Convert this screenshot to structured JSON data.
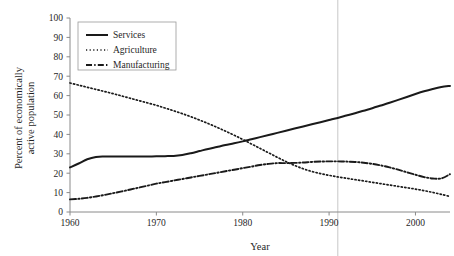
{
  "chart_data": {
    "type": "line",
    "title": "",
    "xlabel": "Year",
    "ylabel": "Percent of economically active population",
    "ylabel_line1": "Percent of economically",
    "ylabel_line2": "active population",
    "xlim": [
      1960,
      2004
    ],
    "ylim": [
      0,
      100
    ],
    "grid": false,
    "legend_position": "top-left",
    "xticks": [
      1960,
      1970,
      1980,
      1990,
      2000
    ],
    "xtick_labels": [
      "1960",
      "1970",
      "1980",
      "1990",
      "2000"
    ],
    "yticks": [
      0,
      10,
      20,
      30,
      40,
      50,
      60,
      70,
      80,
      90,
      100
    ],
    "ytick_labels": [
      "0",
      "10",
      "20",
      "30",
      "40",
      "50",
      "60",
      "70",
      "80",
      "90",
      "100"
    ],
    "annotations": [
      {
        "name": "reference-line-1991",
        "type": "vline",
        "x": 1991,
        "color": "#d8d8d8"
      }
    ],
    "series": [
      {
        "name": "Services",
        "style": "solid",
        "color": "#1a1a1a",
        "x": [
          1960,
          1961,
          1962,
          1963,
          1964,
          1965,
          1966,
          1967,
          1968,
          1969,
          1970,
          1971,
          1972,
          1973,
          1974,
          1975,
          1976,
          1977,
          1978,
          1979,
          1980,
          1981,
          1982,
          1983,
          1984,
          1985,
          1986,
          1987,
          1988,
          1989,
          1990,
          1991,
          1992,
          1993,
          1994,
          1995,
          1996,
          1997,
          1998,
          1999,
          2000,
          2001,
          2002,
          2003,
          2004
        ],
        "values": [
          23.0,
          25.0,
          27.2,
          28.4,
          28.6,
          28.6,
          28.6,
          28.6,
          28.6,
          28.6,
          28.7,
          28.8,
          28.9,
          29.4,
          30.3,
          31.4,
          32.5,
          33.5,
          34.5,
          35.4,
          36.4,
          37.5,
          38.6,
          39.7,
          40.8,
          41.9,
          43.0,
          44.1,
          45.2,
          46.3,
          47.4,
          48.5,
          49.7,
          50.9,
          52.2,
          53.5,
          54.9,
          56.3,
          57.8,
          59.3,
          60.8,
          62.2,
          63.4,
          64.4,
          65.0
        ]
      },
      {
        "name": "Agriculture",
        "style": "dotted",
        "color": "#1a1a1a",
        "x": [
          1960,
          1961,
          1962,
          1963,
          1964,
          1965,
          1966,
          1967,
          1968,
          1969,
          1970,
          1971,
          1972,
          1973,
          1974,
          1975,
          1976,
          1977,
          1978,
          1979,
          1980,
          1981,
          1982,
          1983,
          1984,
          1985,
          1986,
          1987,
          1988,
          1989,
          1990,
          1991,
          1992,
          1993,
          1994,
          1995,
          1996,
          1997,
          1998,
          1999,
          2000,
          2001,
          2002,
          2003,
          2004
        ],
        "values": [
          66.5,
          65.4,
          64.3,
          63.2,
          62.1,
          61.0,
          59.8,
          58.6,
          57.4,
          56.2,
          55.0,
          53.6,
          52.2,
          50.7,
          49.1,
          47.4,
          45.6,
          43.7,
          41.7,
          39.6,
          37.4,
          35.1,
          32.8,
          30.5,
          28.2,
          26.0,
          24.0,
          22.3,
          20.9,
          19.8,
          18.9,
          18.1,
          17.4,
          16.7,
          16.0,
          15.3,
          14.6,
          13.9,
          13.2,
          12.5,
          11.8,
          11.0,
          10.1,
          9.1,
          8.0
        ]
      },
      {
        "name": "Manufacturing",
        "style": "dashdot",
        "color": "#1a1a1a",
        "x": [
          1960,
          1961,
          1962,
          1963,
          1964,
          1965,
          1966,
          1967,
          1968,
          1969,
          1970,
          1971,
          1972,
          1973,
          1974,
          1975,
          1976,
          1977,
          1978,
          1979,
          1980,
          1981,
          1982,
          1983,
          1984,
          1985,
          1986,
          1987,
          1988,
          1989,
          1990,
          1991,
          1992,
          1993,
          1994,
          1995,
          1996,
          1997,
          1998,
          1999,
          2000,
          2001,
          2002,
          2003,
          2004
        ],
        "values": [
          6.5,
          6.8,
          7.3,
          8.0,
          8.8,
          9.7,
          10.6,
          11.6,
          12.6,
          13.6,
          14.6,
          15.4,
          16.2,
          17.0,
          17.8,
          18.6,
          19.4,
          20.2,
          21.0,
          21.8,
          22.6,
          23.4,
          24.2,
          24.8,
          25.2,
          25.2,
          25.3,
          25.5,
          25.8,
          26.0,
          26.1,
          26.1,
          26.0,
          25.8,
          25.4,
          24.8,
          24.0,
          23.0,
          21.8,
          20.5,
          19.2,
          18.0,
          17.3,
          17.3,
          19.5
        ]
      }
    ]
  },
  "legend": {
    "entries": [
      {
        "label": "Services",
        "style": "solid"
      },
      {
        "label": "Agriculture",
        "style": "dotted"
      },
      {
        "label": "Manufacturing",
        "style": "dashdot"
      }
    ]
  }
}
